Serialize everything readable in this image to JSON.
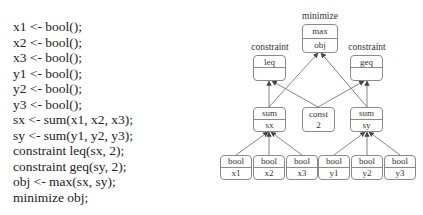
{
  "code": {
    "lines": [
      "x1 <- bool();",
      "x2 <- bool();",
      "x3 <- bool();",
      "y1 <- bool();",
      "y2 <- bool();",
      "y3 <- bool();",
      "sx <- sum(x1, x2, x3);",
      "sy <- sum(y1, y2, y3);",
      "constraint leq(sx, 2);",
      "constraint geq(sy, 2);",
      "obj <- max(sx, sy);",
      "minimize obj;"
    ]
  },
  "graph": {
    "labels": {
      "minimize": "minimize",
      "constraint_left": "constraint",
      "constraint_right": "constraint"
    },
    "nodes": {
      "max": {
        "op": "max",
        "name": "obj"
      },
      "leq": {
        "op": "leq",
        "name": ""
      },
      "geq": {
        "op": "geq",
        "name": ""
      },
      "sx": {
        "op": "sum",
        "name": "sx"
      },
      "const": {
        "op": "const",
        "name": "2"
      },
      "sy": {
        "op": "sum",
        "name": "sy"
      },
      "x1": {
        "op": "bool",
        "name": "x1"
      },
      "x2": {
        "op": "bool",
        "name": "x2"
      },
      "x3": {
        "op": "bool",
        "name": "x3"
      },
      "y1": {
        "op": "bool",
        "name": "y1"
      },
      "y2": {
        "op": "bool",
        "name": "y2"
      },
      "y3": {
        "op": "bool",
        "name": "y3"
      }
    },
    "edges": [
      [
        "x1",
        "sx"
      ],
      [
        "x2",
        "sx"
      ],
      [
        "x3",
        "sx"
      ],
      [
        "y1",
        "sy"
      ],
      [
        "y2",
        "sy"
      ],
      [
        "y3",
        "sy"
      ],
      [
        "sx",
        "leq"
      ],
      [
        "const",
        "leq"
      ],
      [
        "sy",
        "geq"
      ],
      [
        "const",
        "geq"
      ],
      [
        "sx",
        "max"
      ],
      [
        "sy",
        "max"
      ]
    ]
  }
}
